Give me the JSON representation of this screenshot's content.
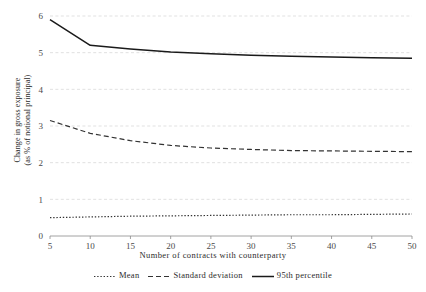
{
  "chart_data": {
    "type": "line",
    "title": "",
    "xlabel": "Number of contracts with counterparty",
    "ylabel_line1": "Change in gross exposure",
    "ylabel_line2": "(as % of notional principal)",
    "x": [
      5,
      10,
      15,
      20,
      25,
      30,
      35,
      40,
      45,
      50
    ],
    "xticks": [
      "5",
      "10",
      "15",
      "20",
      "25",
      "30",
      "35",
      "40",
      "45",
      "50"
    ],
    "yticks": [
      "0",
      "1",
      "2",
      "3",
      "4",
      "5",
      "6"
    ],
    "xlim": [
      5,
      50
    ],
    "ylim": [
      0,
      6
    ],
    "grid": "horizontal-dashed",
    "legend_position": "bottom-center",
    "series": [
      {
        "name": "Mean",
        "style": "dotted",
        "color": "#333333",
        "values": [
          0.5,
          0.52,
          0.54,
          0.55,
          0.56,
          0.57,
          0.58,
          0.58,
          0.59,
          0.6
        ]
      },
      {
        "name": "Standard deviation",
        "style": "dashed",
        "color": "#333333",
        "values": [
          3.15,
          2.8,
          2.6,
          2.47,
          2.4,
          2.36,
          2.33,
          2.32,
          2.31,
          2.3
        ]
      },
      {
        "name": "95th percentile",
        "style": "solid",
        "color": "#1a1a1a",
        "values": [
          5.9,
          5.2,
          5.1,
          5.02,
          4.97,
          4.93,
          4.9,
          4.88,
          4.86,
          4.85
        ]
      }
    ]
  },
  "axes": {
    "gridline_color": "#d9d9d9",
    "axis_color": "#8c8c8c",
    "tick_label_color": "#4a4a4a"
  }
}
